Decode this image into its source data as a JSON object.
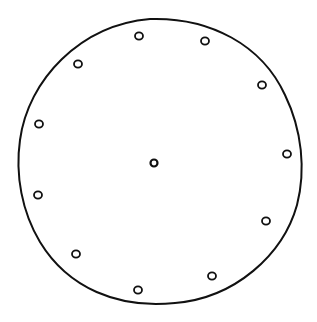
{
  "drawing": {
    "description": "Hand-drawn clock face outline with hour marks",
    "stroke_color": "#111111",
    "background": "#ffffff",
    "outer_circle": {
      "cx": 160,
      "cy": 162,
      "rx": 143,
      "ry": 143
    },
    "center_mark": {
      "cx": 154,
      "cy": 163,
      "r": 3.5
    },
    "hour_marks": [
      {
        "cx": 139,
        "cy": 36
      },
      {
        "cx": 205,
        "cy": 41
      },
      {
        "cx": 262,
        "cy": 85
      },
      {
        "cx": 287,
        "cy": 154
      },
      {
        "cx": 266,
        "cy": 221
      },
      {
        "cx": 212,
        "cy": 276
      },
      {
        "cx": 138,
        "cy": 290
      },
      {
        "cx": 76,
        "cy": 254
      },
      {
        "cx": 38,
        "cy": 195
      },
      {
        "cx": 39,
        "cy": 124
      },
      {
        "cx": 78,
        "cy": 64
      }
    ]
  }
}
